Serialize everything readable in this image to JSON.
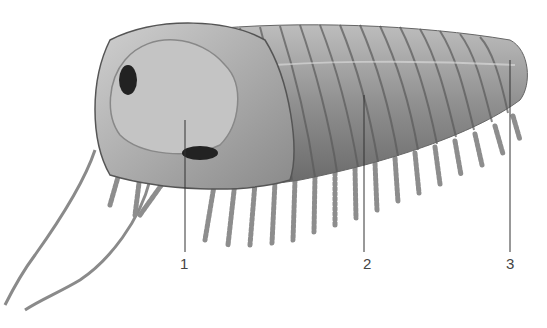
{
  "figure": {
    "labels": [
      {
        "text": "1",
        "x": 185,
        "y": 256,
        "target": "cephalon / glabella"
      },
      {
        "text": "2",
        "x": 368,
        "y": 256,
        "target": "thorax axial lobe"
      },
      {
        "text": "3",
        "x": 511,
        "y": 256,
        "target": "pygidium"
      }
    ]
  }
}
